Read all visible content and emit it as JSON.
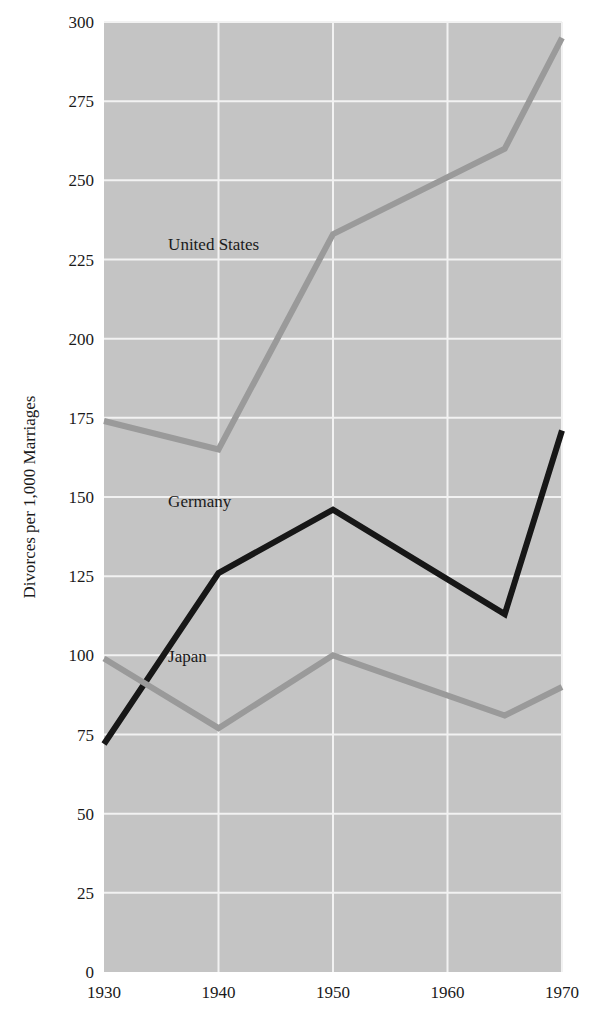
{
  "chart_data": {
    "type": "line",
    "title": "",
    "subtitle": "",
    "xlabel": "",
    "ylabel": "Divorces per 1,000 Marriages",
    "x": [
      1930,
      1940,
      1950,
      1965,
      1970
    ],
    "xlim": [
      1930,
      1970
    ],
    "ylim": [
      0,
      300
    ],
    "xticks": [
      1930,
      1940,
      1950,
      1960,
      1970
    ],
    "xtick_labels": [
      "1930",
      "1940",
      "1950",
      "1960",
      "1970"
    ],
    "yticks": [
      0,
      25,
      50,
      75,
      100,
      125,
      150,
      175,
      200,
      225,
      250,
      275,
      300
    ],
    "ytick_labels": [
      "0",
      "25",
      "50",
      "75",
      "100",
      "125",
      "150",
      "175",
      "200",
      "225",
      "250",
      "275",
      "300"
    ],
    "grid": true,
    "grid_color": "#f2f2f2",
    "plot_background": "#c4c4c4",
    "legend_position": "inline-annotations",
    "series": [
      {
        "name": "United States",
        "color": "#9a9a9a",
        "values": [
          174,
          165,
          233,
          260,
          295
        ],
        "label_x": 1935.6,
        "label_y": 228
      },
      {
        "name": "Germany",
        "color": "#171717",
        "values": [
          72,
          126,
          146,
          113,
          171
        ],
        "label_x": 1935.6,
        "label_y": 147
      },
      {
        "name": "Japan",
        "color": "#9a9a9a",
        "values": [
          99,
          77,
          100,
          81,
          90
        ],
        "label_x": 1935.6,
        "label_y": 98
      }
    ]
  },
  "annotations": {
    "united_states_label": "United States",
    "germany_label": "Germany",
    "japan_label": "Japan"
  },
  "axes": {
    "y_axis_title": "Divorces per 1,000 Marriages"
  }
}
